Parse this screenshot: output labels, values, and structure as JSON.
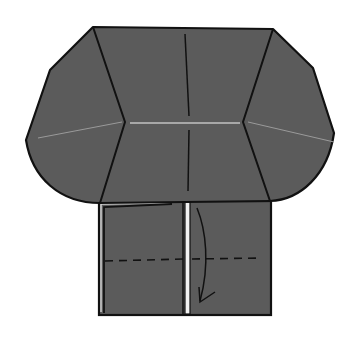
{
  "diagram": {
    "type": "origami-fold-step",
    "colors": {
      "paper_fill": "#5b5b5b",
      "outline": "#111111",
      "crease_light": "#a8a8a8",
      "background": "#ffffff",
      "strip_white": "#f2f2f2"
    },
    "elements": {
      "upper_body": "folded paper body with angled side flaps",
      "lower_flap": "rectangular lower flap",
      "valley_fold_line": "dashed horizontal fold line",
      "fold_arrow": "curved arrow indicating fold direction (downward)",
      "center_strip": "white vertical strip showing paper edge"
    }
  }
}
